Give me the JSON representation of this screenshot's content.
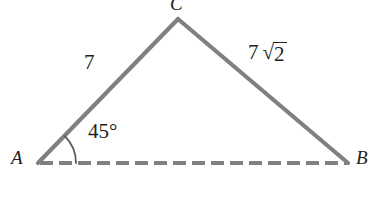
{
  "figure": {
    "kind": "geometry-triangle",
    "background_color": "#ffffff",
    "stroke_color": "#808080",
    "text_color": "#231f20",
    "vertices": {
      "A": {
        "label": "A",
        "x": 38,
        "y": 163
      },
      "B": {
        "label": "B",
        "x": 348,
        "y": 163
      },
      "C": {
        "label": "C",
        "x": 178,
        "y": 19
      }
    },
    "sides": [
      {
        "name": "side-AC",
        "from": "A",
        "to": "C",
        "style": "solid",
        "length_label": "7"
      },
      {
        "name": "side-CB",
        "from": "C",
        "to": "B",
        "style": "solid",
        "length_label_coefficient": "7",
        "length_label_radical_sign": "√",
        "length_label_radicand": "2",
        "length_label_plain": "7√2"
      },
      {
        "name": "side-AB",
        "from": "A",
        "to": "B",
        "style": "dashed",
        "length_label": ""
      }
    ],
    "angles": [
      {
        "name": "angle-at-A",
        "vertex": "A",
        "measure": "45°",
        "arc_radius": 38
      }
    ]
  }
}
